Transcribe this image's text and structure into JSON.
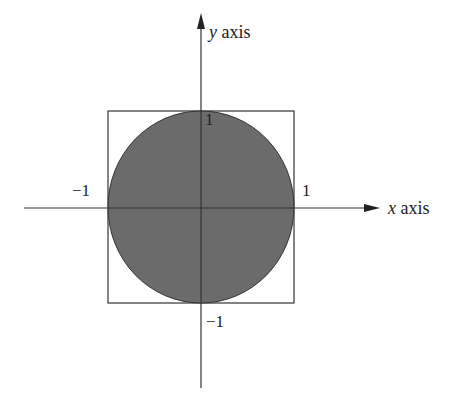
{
  "diagram": {
    "x_axis": {
      "var": "x",
      "label": " axis"
    },
    "y_axis": {
      "var": "y",
      "label": " axis"
    },
    "ticks": {
      "x_pos": "1",
      "x_neg": "−1",
      "y_pos": "1",
      "y_neg": "−1"
    },
    "shapes": {
      "square": {
        "side": 2,
        "center": [
          0,
          0
        ]
      },
      "circle": {
        "radius": 1,
        "center": [
          0,
          0
        ],
        "fill": "#6b6b6b"
      }
    },
    "colors": {
      "line": "#222222",
      "circle_fill": "#6b6b6b",
      "background": "#ffffff"
    }
  }
}
